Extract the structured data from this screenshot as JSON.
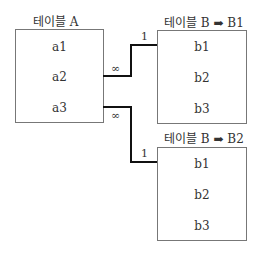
{
  "tables": [
    {
      "id": "A",
      "title": "테이블 A",
      "rows": [
        "a1",
        "a2",
        "a3"
      ]
    },
    {
      "id": "B1",
      "title": "테이블 B ➡ B1",
      "rows": [
        "b1",
        "b2",
        "b3"
      ]
    },
    {
      "id": "B2",
      "title": "테이블 B ➡ B2",
      "rows": [
        "b1",
        "b2",
        "b3"
      ]
    }
  ],
  "relations": [
    {
      "from": "A.a2",
      "to": "B1.b1",
      "from_card": "∞",
      "to_card": "1"
    },
    {
      "from": "A.a3",
      "to": "B2.b1",
      "from_card": "∞",
      "to_card": "1"
    }
  ]
}
